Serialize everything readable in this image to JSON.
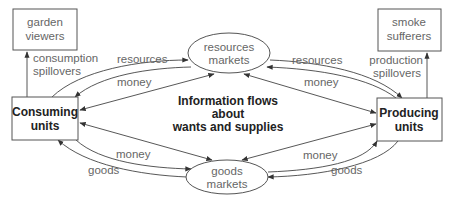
{
  "diagram": {
    "center_text": [
      "Information flows",
      "about",
      "wants and supplies"
    ],
    "nodes": {
      "garden_viewers": [
        "garden",
        "viewers"
      ],
      "smoke_sufferers": [
        "smoke",
        "sufferers"
      ],
      "consuming_units": [
        "Consuming",
        "units"
      ],
      "producing_units": [
        "Producing",
        "units"
      ],
      "resources_markets": [
        "resources",
        "markets"
      ],
      "goods_markets": [
        "goods",
        "markets"
      ]
    },
    "edge_labels": {
      "consumption_spillovers": [
        "consumption",
        "spillovers"
      ],
      "production_spillovers": [
        "production",
        "spillovers"
      ],
      "left_resources": "resources",
      "left_money_top": "money",
      "right_resources": "resources",
      "right_money_top": "money",
      "left_money_bottom": "money",
      "left_goods": "goods",
      "right_money_bottom": "money",
      "right_goods": "goods"
    },
    "colors": {
      "stroke": "#444444",
      "label_text": "#666666",
      "bold_text": "#222222"
    }
  }
}
